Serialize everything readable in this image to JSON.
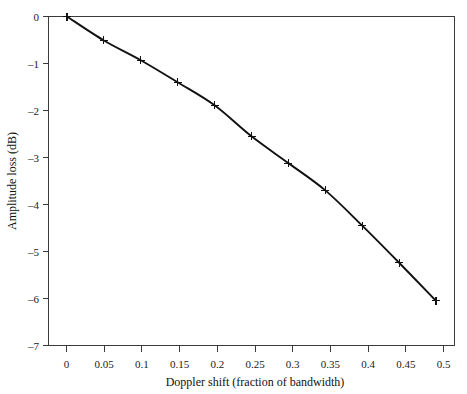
{
  "chart_data": {
    "type": "line",
    "title": "",
    "subtitle": "",
    "xlabel": "Doppler shift (fraction of bandwidth)",
    "ylabel": "Amplitude loss (dB)",
    "x": [
      0,
      0.05,
      0.1,
      0.15,
      0.2,
      0.25,
      0.3,
      0.35,
      0.4,
      0.45,
      0.5
    ],
    "values": [
      0,
      -0.51,
      -0.93,
      -1.4,
      -1.89,
      -2.55,
      -3.12,
      -3.7,
      -4.45,
      -5.24,
      -6.05
    ],
    "series": [
      {
        "name": "Amplitude loss",
        "values": [
          0,
          -0.51,
          -0.93,
          -1.4,
          -1.89,
          -2.55,
          -3.12,
          -3.7,
          -4.45,
          -5.24,
          -6.05
        ]
      }
    ],
    "xlim": [
      -0.025,
      0.525
    ],
    "ylim": [
      -7,
      0
    ],
    "xticks": [
      0,
      0.05,
      0.1,
      0.15,
      0.2,
      0.25,
      0.3,
      0.35,
      0.4,
      0.45,
      0.5
    ],
    "xtick_labels": [
      "0",
      "0.05",
      "0.1",
      "0.15",
      "0.2",
      "0.25",
      "0.3",
      "0.35",
      "0.4",
      "0.45",
      "0.5"
    ],
    "yticks": [
      0,
      -1,
      -2,
      -3,
      -4,
      -5,
      -6,
      -7
    ],
    "ytick_labels": [
      "0",
      "–1",
      "–2",
      "–3",
      "–4",
      "–5",
      "–6",
      "–7"
    ],
    "grid": false,
    "legend": false,
    "legend_position": "none",
    "marker": "plus",
    "line_color": "#111111",
    "frame_color": "#3a3a3a",
    "background_color": "#ffffff"
  }
}
